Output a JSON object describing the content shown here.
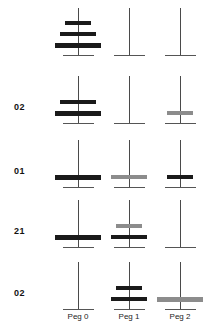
{
  "figure": {
    "type": "towers-of-hanoi-sequence",
    "peg_captions": [
      "Peg 0",
      "Peg 1",
      "Peg 2"
    ],
    "peg_centers_px": [
      78,
      129,
      180
    ],
    "colors": {
      "disc_dark": "#1a1a1a",
      "disc_gray": "#8c8c8c",
      "rod": "#4a4a4a",
      "base": "#555555",
      "label_text": "#121212",
      "caption_text": "#1d1d1d",
      "background": "#ffffff"
    },
    "disc_sizes": {
      "small": {
        "width": 26,
        "height": 4
      },
      "medium": {
        "width": 36,
        "height": 4
      },
      "large": {
        "width": 46,
        "height": 5
      }
    },
    "rod": {
      "width": 1,
      "height": 47
    },
    "base": {
      "width": 31,
      "height": 1
    },
    "rows": [
      {
        "label": "",
        "top": 8,
        "pegs": [
          {
            "peg": 0,
            "discs": [
              {
                "size": "small",
                "color": "dark"
              },
              {
                "size": "medium",
                "color": "dark"
              },
              {
                "size": "large",
                "color": "dark"
              }
            ]
          },
          {
            "peg": 1,
            "discs": []
          },
          {
            "peg": 2,
            "discs": []
          }
        ]
      },
      {
        "label": "02",
        "top": 76,
        "pegs": [
          {
            "peg": 0,
            "discs": [
              {
                "size": "medium",
                "color": "dark"
              },
              {
                "size": "large",
                "color": "dark"
              }
            ]
          },
          {
            "peg": 1,
            "discs": []
          },
          {
            "peg": 2,
            "discs": [
              {
                "size": "small",
                "color": "gray"
              }
            ]
          }
        ]
      },
      {
        "label": "01",
        "top": 140,
        "pegs": [
          {
            "peg": 0,
            "discs": [
              {
                "size": "large",
                "color": "dark"
              }
            ]
          },
          {
            "peg": 1,
            "discs": [
              {
                "size": "medium",
                "color": "gray"
              }
            ]
          },
          {
            "peg": 2,
            "discs": [
              {
                "size": "small",
                "color": "dark"
              }
            ]
          }
        ]
      },
      {
        "label": "21",
        "top": 200,
        "pegs": [
          {
            "peg": 0,
            "discs": [
              {
                "size": "large",
                "color": "dark"
              }
            ]
          },
          {
            "peg": 1,
            "discs": [
              {
                "size": "small",
                "color": "gray"
              },
              {
                "size": "medium",
                "color": "dark"
              }
            ]
          },
          {
            "peg": 2,
            "discs": []
          }
        ]
      },
      {
        "label": "02",
        "top": 262,
        "pegs": [
          {
            "peg": 0,
            "discs": []
          },
          {
            "peg": 1,
            "discs": [
              {
                "size": "small",
                "color": "dark"
              },
              {
                "size": "medium",
                "color": "dark"
              }
            ]
          },
          {
            "peg": 2,
            "discs": [
              {
                "size": "large",
                "color": "gray"
              }
            ]
          }
        ]
      }
    ],
    "caption_row_top": 312,
    "label_left": 14
  }
}
